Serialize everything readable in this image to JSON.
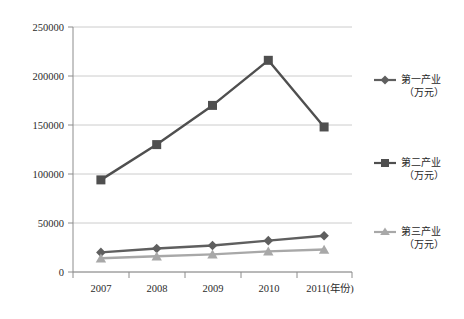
{
  "chart_data": {
    "type": "line",
    "title": "",
    "subtitle": "",
    "xlabel": "年份",
    "ylabel": "",
    "categories": [
      "2007",
      "2008",
      "2009",
      "2010",
      "2011"
    ],
    "xtick_labels": [
      "2007",
      "2008",
      "2009",
      "2010",
      "2011(年份)"
    ],
    "ylim": [
      0,
      250000
    ],
    "ytick_labels": [
      "0",
      "50000",
      "100000",
      "150000",
      "200000",
      "250000"
    ],
    "ytick_values": [
      0,
      50000,
      100000,
      150000,
      200000,
      250000
    ],
    "grid": "horizontal",
    "legend_position": "right",
    "series": [
      {
        "name": "第一产业",
        "unit": "（万元）",
        "legend_label_line1": "第一产业",
        "legend_label_line2": "（万元）",
        "marker": "diamond",
        "color": "#5f5f5f",
        "values": [
          20000,
          24000,
          27000,
          32000,
          37000
        ]
      },
      {
        "name": "第二产业",
        "unit": "（万元）",
        "legend_label_line1": "第二产业",
        "legend_label_line2": "（万元）",
        "marker": "square",
        "color": "#4f4f4f",
        "values": [
          94000,
          130000,
          170000,
          216000,
          148000
        ]
      },
      {
        "name": "第三产业",
        "unit": "（万元）",
        "legend_label_line1": "第三产业",
        "legend_label_line2": "（万元）",
        "marker": "triangle",
        "color": "#a8a8a8",
        "values": [
          14000,
          16000,
          18000,
          21000,
          23000
        ]
      }
    ],
    "colors": {
      "grid": "#bfbfbf",
      "axis": "#8c8c8c",
      "text": "#2b2b2b",
      "background": "#ffffff"
    }
  }
}
